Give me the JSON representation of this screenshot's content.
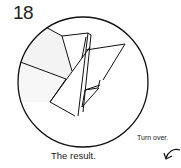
{
  "step": {
    "number": "18"
  },
  "caption": "The result.",
  "instruction": "Turn over.",
  "icons": {
    "turn_over": "turn-over-arrow-icon"
  },
  "colors": {
    "stroke": "#111111",
    "shade": "#f2f2f2"
  }
}
